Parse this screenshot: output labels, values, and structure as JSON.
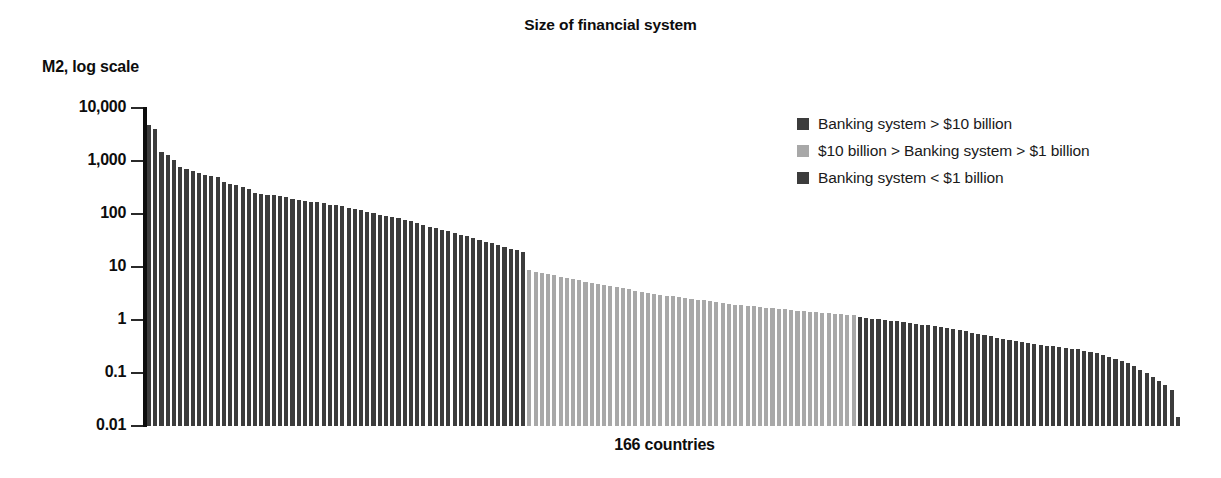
{
  "chart_data": {
    "type": "bar",
    "title": "Size of financial system",
    "xlabel": "166 countries",
    "ylabel": "M2, log scale",
    "yscale": "log",
    "ylim": [
      0.01,
      10000
    ],
    "ytick_labels": [
      "10,000",
      "1,000",
      "100",
      "10",
      "1",
      "0.1",
      "0.01"
    ],
    "ytick_values": [
      10000,
      1000,
      100,
      10,
      1,
      0.1,
      0.01
    ],
    "grid": false,
    "legend_position": "upper right",
    "n_categories": 166,
    "series": [
      {
        "name": "Banking system > $10 billion",
        "color": "#3c3c3c",
        "index_range": [
          0,
          60
        ]
      },
      {
        "name": "$10 billion > Banking system > $1 billion",
        "color": "#a8a8a8",
        "index_range": [
          61,
          113
        ]
      },
      {
        "name": "Banking system < $1 billion",
        "color": "#3c3c3c",
        "index_range": [
          114,
          165
        ]
      }
    ],
    "values": [
      4700,
      4100,
      1450,
      1280,
      1050,
      760,
      700,
      640,
      600,
      555,
      530,
      505,
      400,
      370,
      350,
      330,
      300,
      250,
      240,
      230,
      225,
      215,
      205,
      195,
      185,
      175,
      170,
      165,
      158,
      150,
      145,
      140,
      132,
      125,
      118,
      110,
      103,
      97,
      92,
      88,
      83,
      78,
      73,
      68,
      63,
      58,
      54,
      50,
      47,
      44,
      41,
      38,
      35,
      32,
      30,
      28,
      26,
      24,
      22,
      21,
      19.5,
      8.6,
      8.2,
      7.8,
      7.4,
      7.0,
      6.6,
      6.2,
      5.9,
      5.6,
      5.3,
      5.0,
      4.8,
      4.6,
      4.4,
      4.2,
      4.0,
      3.8,
      3.6,
      3.45,
      3.3,
      3.15,
      3.0,
      2.9,
      2.8,
      2.7,
      2.6,
      2.5,
      2.42,
      2.34,
      2.26,
      2.18,
      2.1,
      2.02,
      1.95,
      1.9,
      1.85,
      1.8,
      1.75,
      1.7,
      1.66,
      1.62,
      1.58,
      1.54,
      1.5,
      1.47,
      1.44,
      1.41,
      1.38,
      1.35,
      1.32,
      1.29,
      1.26,
      1.23,
      1.12,
      1.09,
      1.06,
      1.03,
      1.0,
      0.97,
      0.94,
      0.91,
      0.88,
      0.85,
      0.82,
      0.79,
      0.76,
      0.73,
      0.7,
      0.67,
      0.64,
      0.61,
      0.58,
      0.55,
      0.52,
      0.49,
      0.46,
      0.44,
      0.42,
      0.4,
      0.385,
      0.37,
      0.355,
      0.34,
      0.33,
      0.32,
      0.31,
      0.3,
      0.29,
      0.28,
      0.265,
      0.25,
      0.235,
      0.22,
      0.2,
      0.185,
      0.17,
      0.155,
      0.135,
      0.115,
      0.1,
      0.085,
      0.072,
      0.06,
      0.048,
      0.015
    ]
  },
  "legend": {
    "items": [
      {
        "label": "Banking system > $10 billion",
        "color": "#3c3c3c"
      },
      {
        "label": "$10 billion > Banking system > $1 billion",
        "color": "#a8a8a8"
      },
      {
        "label": "Banking system < $1 billion",
        "color": "#3c3c3c"
      }
    ]
  }
}
